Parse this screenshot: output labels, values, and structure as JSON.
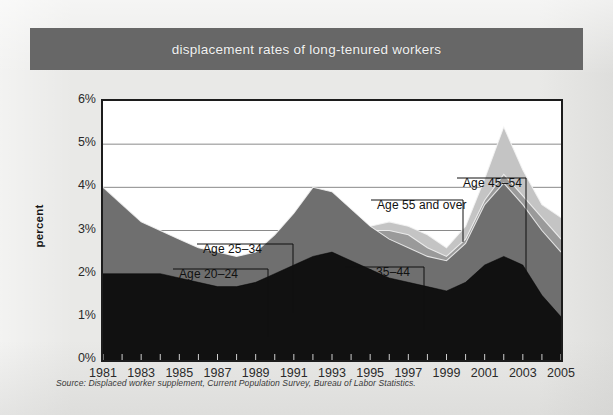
{
  "title": "displacement rates of long-tenured workers",
  "source_note": "Source: Displaced worker supplement, Current Population Survey, Bureau of Labor Statistics.",
  "colors": {
    "title_band": "#676767",
    "page_background": "#e9e9e7",
    "plot_background": "#ffffff",
    "frame": "#1c1c1c",
    "gridline": "#8a8a8a",
    "series_20_24": "#111111",
    "series_25_34": "#6f6f6f",
    "series_35_44": "#9a9a9a",
    "series_45_54": "#c4c4c4",
    "series_55_over": "#efefef"
  },
  "annotations": [
    {
      "id": "age-20-24",
      "label": "Age 20–24",
      "text_x": 179,
      "text_y": 205,
      "elbow_x": 268,
      "elbow_y": 199,
      "tip_x": 268,
      "tip_y": 267
    },
    {
      "id": "age-25-34",
      "label": "Age 25–34",
      "text_x": 203,
      "text_y": 180,
      "elbow_x": 293,
      "elbow_y": 174,
      "tip_x": 293,
      "tip_y": 243
    },
    {
      "id": "age-35-44",
      "label": "Age 35–44",
      "text_x": 351,
      "text_y": 203,
      "elbow_x": 424,
      "elbow_y": 197,
      "tip_x": 424,
      "tip_y": 260
    },
    {
      "id": "age-55-over",
      "label": "Age 55 and over",
      "text_x": 377,
      "text_y": 136,
      "elbow_x": 463,
      "elbow_y": 130,
      "tip_x": 463,
      "tip_y": 172
    },
    {
      "id": "age-45-54",
      "label": "Age 45–54",
      "text_x": 463,
      "text_y": 114,
      "elbow_x": 526,
      "elbow_y": 108,
      "tip_x": 526,
      "tip_y": 205
    }
  ],
  "chart_data": {
    "type": "area",
    "title": "displacement rates of long-tenured workers",
    "subtitle": "",
    "xlabel": "",
    "ylabel": "percent",
    "xlim": [
      1981,
      2005
    ],
    "ylim": [
      0,
      6
    ],
    "grid": true,
    "grid_axis": "y",
    "legend": "inline-annotations",
    "y_ticks": [
      0,
      1,
      2,
      3,
      4,
      5,
      6
    ],
    "y_tick_labels": [
      "0%",
      "1%",
      "2%",
      "3%",
      "4%",
      "5%",
      "6%"
    ],
    "x_tick_labels": [
      "1981",
      "1983",
      "1985",
      "1987",
      "1989",
      "1991",
      "1993",
      "1995",
      "1997",
      "1999",
      "2001",
      "2003",
      "2005"
    ],
    "x": [
      1981,
      1982,
      1983,
      1984,
      1985,
      1986,
      1987,
      1988,
      1989,
      1990,
      1991,
      1992,
      1993,
      1994,
      1995,
      1996,
      1997,
      1998,
      1999,
      2000,
      2001,
      2002,
      2003,
      2004,
      2005
    ],
    "series": [
      {
        "name": "Age 20–24",
        "color": "#111111",
        "values": [
          2.0,
          2.0,
          2.0,
          2.0,
          1.9,
          1.8,
          1.7,
          1.7,
          1.8,
          2.0,
          2.2,
          2.4,
          2.5,
          2.3,
          2.1,
          1.9,
          1.8,
          1.7,
          1.6,
          1.8,
          2.2,
          2.4,
          2.2,
          1.5,
          1.0
        ]
      },
      {
        "name": "Age 25–34",
        "color": "#6f6f6f",
        "values": [
          4.0,
          3.6,
          3.2,
          3.0,
          2.8,
          2.6,
          2.5,
          2.4,
          2.5,
          2.9,
          3.4,
          4.0,
          3.9,
          3.5,
          3.1,
          2.8,
          2.6,
          2.4,
          2.3,
          2.7,
          3.6,
          4.1,
          3.6,
          3.0,
          2.5
        ]
      },
      {
        "name": "Age 35–44",
        "color": "#9a9a9a",
        "values": [
          3.7,
          3.4,
          3.0,
          2.7,
          2.6,
          2.5,
          2.4,
          2.3,
          2.4,
          2.8,
          3.3,
          3.9,
          3.8,
          3.4,
          3.0,
          3.0,
          2.9,
          2.6,
          2.4,
          2.8,
          3.7,
          4.3,
          3.8,
          3.3,
          2.8
        ]
      },
      {
        "name": "Age 45–54",
        "color": "#c4c4c4",
        "values": [
          3.4,
          3.1,
          2.8,
          2.6,
          2.5,
          2.4,
          2.3,
          2.2,
          2.3,
          2.7,
          3.2,
          3.7,
          3.6,
          3.3,
          3.1,
          3.2,
          3.1,
          2.9,
          2.6,
          3.1,
          4.2,
          5.4,
          4.4,
          3.6,
          3.3
        ]
      },
      {
        "name": "Age 55 and over",
        "color": "#efefef",
        "values": [
          3.2,
          2.9,
          2.6,
          2.5,
          2.4,
          2.3,
          2.2,
          2.1,
          2.2,
          2.6,
          3.1,
          3.5,
          3.4,
          3.2,
          3.0,
          3.1,
          3.0,
          2.8,
          2.5,
          3.0,
          4.0,
          5.2,
          4.3,
          3.5,
          3.2
        ]
      }
    ]
  }
}
